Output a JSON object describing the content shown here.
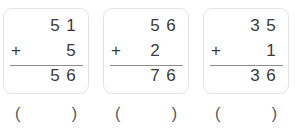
{
  "worksheet": {
    "title": "Vertical addition worksheet",
    "colors": {
      "background": "#ffffff",
      "box_border": "#e3e3e3",
      "digit": "#3a3a3a",
      "rule": "#8d8d8d",
      "paren": "#555555"
    },
    "plus_symbol": "+",
    "blank": "",
    "answer_parens": {
      "open": "(",
      "close": ")"
    },
    "problems": [
      {
        "id": "problem-1",
        "addend1": {
          "value": "51",
          "tens": "5",
          "ones": "1"
        },
        "addend2": {
          "value": "5",
          "tens": "",
          "ones": "5"
        },
        "operator": "+",
        "sum": {
          "value": "56",
          "tens": "5",
          "ones": "6"
        },
        "answer_box": ""
      },
      {
        "id": "problem-2",
        "addend1": {
          "value": "56",
          "tens": "5",
          "ones": "6"
        },
        "addend2": {
          "value": "2",
          "tens": "2",
          "ones": ""
        },
        "operator": "+",
        "sum": {
          "value": "76",
          "tens": "7",
          "ones": "6"
        },
        "answer_box": ""
      },
      {
        "id": "problem-3",
        "addend1": {
          "value": "35",
          "tens": "3",
          "ones": "5"
        },
        "addend2": {
          "value": "1",
          "tens": "",
          "ones": "1"
        },
        "operator": "+",
        "sum": {
          "value": "36",
          "tens": "3",
          "ones": "6"
        },
        "answer_box": ""
      }
    ]
  }
}
